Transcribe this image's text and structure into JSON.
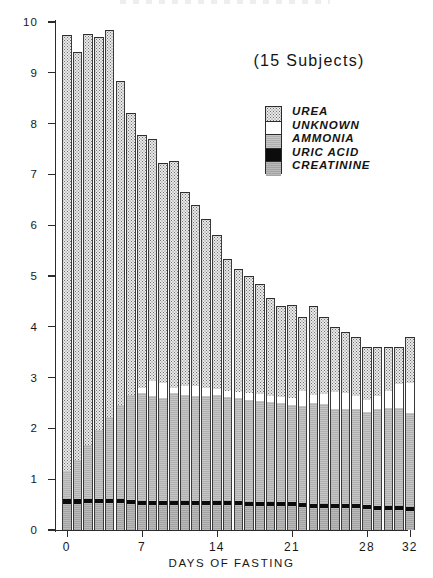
{
  "figure": {
    "annotation": "(15 Subjects)",
    "colors": {
      "urea": "#e9e9e9",
      "unknown": "#ffffff",
      "ammonia": "#b9b9b9",
      "uric_acid": "#0c0c0c",
      "creatinine": "#adadad",
      "ink": "#2b2b2b",
      "paper": "#ffffff"
    }
  },
  "legend": {
    "items": [
      {
        "label": "UREA",
        "key": "urea",
        "swatch": "stipple-light"
      },
      {
        "label": "UNKNOWN",
        "key": "unknown",
        "swatch": "white"
      },
      {
        "label": "AMMONIA",
        "key": "ammonia",
        "swatch": "gray-medium"
      },
      {
        "label": "URIC ACID",
        "key": "uric_acid",
        "swatch": "black"
      },
      {
        "label": "CREATININE",
        "key": "creatinine",
        "swatch": "gray"
      }
    ]
  },
  "chart_data": {
    "type": "bar",
    "stacked": true,
    "title": "",
    "annotation": "(15 Subjects)",
    "xlabel": "DAYS OF FASTING",
    "ylabel": "GRAMS / 24 HOURS",
    "xlim": [
      -0.5,
      32.5
    ],
    "ylim": [
      0,
      10
    ],
    "ytick_labels": [
      "0",
      "1",
      "2",
      "3",
      "4",
      "5",
      "6",
      "7",
      "8",
      "9",
      "10"
    ],
    "yticks": [
      0,
      1,
      2,
      3,
      4,
      5,
      6,
      7,
      8,
      9,
      10
    ],
    "xticks": [
      0,
      7,
      14,
      21,
      28,
      32
    ],
    "xtick_labels": [
      "0",
      "7",
      "14",
      "21",
      "28",
      "32"
    ],
    "grid": false,
    "legend_position": "upper-right-inside",
    "categories": [
      0,
      1,
      2,
      3,
      4,
      5,
      6,
      7,
      8,
      9,
      10,
      11,
      12,
      13,
      14,
      15,
      16,
      17,
      18,
      19,
      20,
      21,
      22,
      23,
      24,
      25,
      26,
      27,
      28,
      29,
      30,
      31,
      32
    ],
    "series": [
      {
        "name": "CREATININE",
        "key": "creatinine",
        "values": [
          0.52,
          0.52,
          0.54,
          0.54,
          0.54,
          0.54,
          0.52,
          0.5,
          0.5,
          0.5,
          0.5,
          0.5,
          0.5,
          0.5,
          0.5,
          0.5,
          0.5,
          0.48,
          0.48,
          0.48,
          0.48,
          0.48,
          0.46,
          0.44,
          0.44,
          0.44,
          0.44,
          0.44,
          0.42,
          0.4,
          0.4,
          0.4,
          0.38
        ]
      },
      {
        "name": "URIC ACID",
        "key": "uric_acid",
        "values": [
          0.1,
          0.1,
          0.08,
          0.08,
          0.08,
          0.08,
          0.08,
          0.08,
          0.08,
          0.08,
          0.08,
          0.08,
          0.08,
          0.08,
          0.08,
          0.08,
          0.08,
          0.08,
          0.08,
          0.08,
          0.08,
          0.08,
          0.08,
          0.08,
          0.08,
          0.08,
          0.08,
          0.08,
          0.08,
          0.08,
          0.08,
          0.08,
          0.08
        ]
      },
      {
        "name": "AMMONIA",
        "key": "ammonia",
        "values": [
          0.55,
          0.75,
          1.05,
          1.35,
          1.6,
          1.85,
          2.05,
          2.12,
          2.05,
          2.02,
          2.12,
          2.08,
          2.06,
          2.06,
          2.08,
          2.04,
          2.02,
          2.0,
          1.98,
          1.96,
          1.94,
          1.9,
          1.9,
          1.98,
          1.96,
          1.86,
          1.86,
          1.86,
          1.82,
          1.9,
          1.92,
          1.92,
          1.84
        ]
      },
      {
        "name": "UNKNOWN",
        "key": "unknown",
        "values": [
          0.0,
          0.0,
          0.0,
          0.0,
          0.0,
          0.0,
          0.0,
          0.1,
          0.3,
          0.3,
          0.1,
          0.18,
          0.2,
          0.16,
          0.12,
          0.12,
          0.12,
          0.14,
          0.14,
          0.12,
          0.12,
          0.14,
          0.3,
          0.16,
          0.2,
          0.34,
          0.32,
          0.26,
          0.24,
          0.26,
          0.34,
          0.48,
          0.6
        ]
      },
      {
        "name": "UREA",
        "key": "urea",
        "values": [
          8.58,
          8.03,
          8.09,
          7.74,
          7.63,
          6.36,
          5.56,
          4.98,
          4.77,
          4.33,
          4.46,
          3.82,
          3.56,
          3.32,
          3.02,
          2.6,
          2.42,
          2.3,
          2.16,
          1.92,
          1.78,
          1.82,
          1.46,
          1.74,
          1.52,
          1.28,
          1.2,
          1.16,
          1.04,
          0.96,
          0.86,
          0.72,
          0.9
        ]
      }
    ],
    "totals": [
      9.75,
      9.4,
      9.76,
      9.71,
      9.85,
      8.83,
      8.21,
      7.78,
      7.7,
      7.23,
      7.26,
      6.66,
      6.4,
      6.12,
      5.8,
      5.34,
      5.14,
      5.0,
      4.84,
      4.56,
      4.4,
      4.42,
      4.2,
      4.4,
      4.2,
      4.0,
      3.9,
      3.8,
      3.6,
      3.6,
      3.6,
      3.6,
      3.8
    ]
  },
  "axes": {
    "y_label": "GRAMS / 24 HOURS",
    "x_label": "DAYS OF FASTING"
  }
}
